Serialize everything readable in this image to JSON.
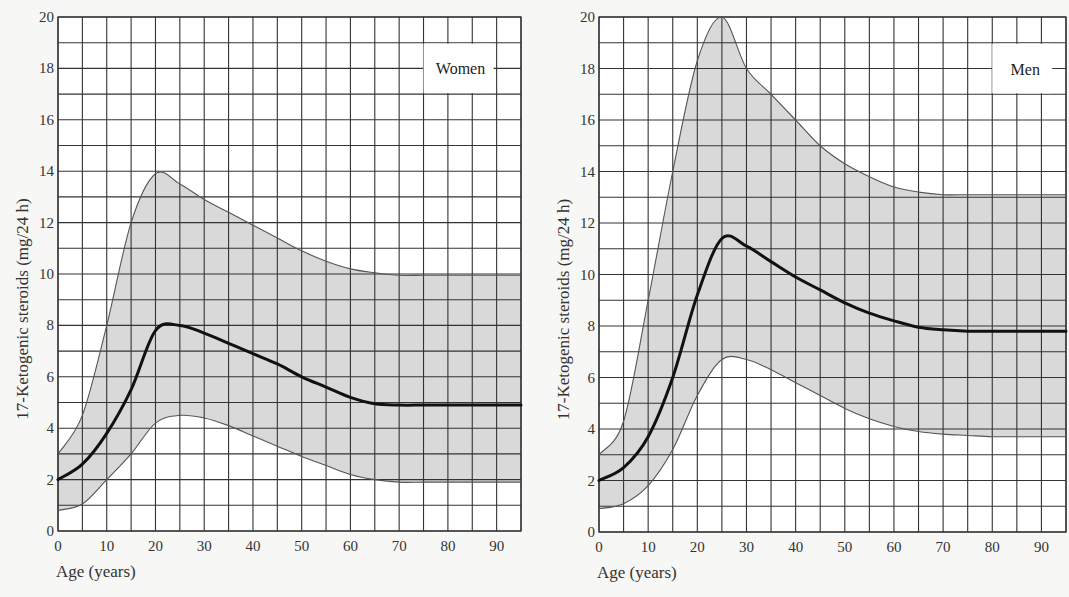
{
  "chart_data": [
    {
      "type": "line",
      "title": "Women",
      "xlabel": "Age (years)",
      "ylabel": "17-Ketogenic steroids (mg/24 h)",
      "xlim": [
        0,
        95
      ],
      "ylim": [
        0,
        20
      ],
      "xticks": [
        0,
        10,
        20,
        30,
        40,
        50,
        60,
        70,
        80,
        90
      ],
      "yticks": [
        0,
        2,
        4,
        6,
        8,
        10,
        12,
        14,
        16,
        18,
        20
      ],
      "grid": true,
      "grid_minor_x": 5,
      "grid_minor_y": 1,
      "legend_position": "top-right",
      "shaded_band": "between upper and lower",
      "x": [
        0,
        5,
        10,
        15,
        20,
        25,
        30,
        35,
        40,
        45,
        50,
        55,
        60,
        65,
        70,
        75,
        80,
        85,
        90,
        95
      ],
      "series": [
        {
          "name": "upper",
          "values": [
            3.0,
            4.5,
            8.0,
            12.0,
            13.9,
            13.5,
            12.9,
            12.4,
            11.9,
            11.4,
            10.9,
            10.5,
            10.2,
            10.05,
            9.95,
            9.95,
            9.95,
            9.95,
            9.95,
            9.95
          ]
        },
        {
          "name": "mean",
          "values": [
            2.0,
            2.6,
            3.8,
            5.5,
            7.8,
            8.0,
            7.7,
            7.3,
            6.9,
            6.5,
            6.0,
            5.6,
            5.2,
            4.95,
            4.9,
            4.9,
            4.9,
            4.9,
            4.9,
            4.9
          ]
        },
        {
          "name": "lower",
          "values": [
            0.8,
            1.05,
            2.0,
            3.0,
            4.2,
            4.5,
            4.4,
            4.1,
            3.7,
            3.3,
            2.9,
            2.55,
            2.2,
            2.0,
            1.9,
            1.9,
            1.9,
            1.9,
            1.9,
            1.9
          ]
        }
      ]
    },
    {
      "type": "line",
      "title": "Men",
      "xlabel": "Age (years)",
      "ylabel": "17-Ketogenic steroids (mg/24 h)",
      "xlim": [
        0,
        95
      ],
      "ylim": [
        0,
        20
      ],
      "xticks": [
        0,
        10,
        20,
        30,
        40,
        50,
        60,
        70,
        80,
        90
      ],
      "yticks": [
        0,
        2,
        4,
        6,
        8,
        10,
        12,
        14,
        16,
        18,
        20
      ],
      "grid": true,
      "grid_minor_x": 5,
      "grid_minor_y": 1,
      "legend_position": "top-right",
      "shaded_band": "between upper and lower",
      "x": [
        0,
        5,
        10,
        15,
        20,
        25,
        30,
        35,
        40,
        45,
        50,
        55,
        60,
        65,
        70,
        75,
        80,
        85,
        90,
        95
      ],
      "series": [
        {
          "name": "upper",
          "values": [
            3.0,
            4.3,
            9.0,
            14.0,
            18.3,
            20.0,
            18.0,
            17.0,
            16.0,
            15.0,
            14.3,
            13.8,
            13.4,
            13.2,
            13.1,
            13.1,
            13.1,
            13.1,
            13.1,
            13.1
          ]
        },
        {
          "name": "mean",
          "values": [
            2.0,
            2.5,
            3.7,
            6.0,
            9.2,
            11.4,
            11.1,
            10.5,
            9.9,
            9.4,
            8.9,
            8.5,
            8.2,
            7.95,
            7.85,
            7.8,
            7.8,
            7.8,
            7.8,
            7.8
          ]
        },
        {
          "name": "lower",
          "values": [
            0.9,
            1.1,
            1.8,
            3.2,
            5.3,
            6.7,
            6.7,
            6.3,
            5.8,
            5.3,
            4.8,
            4.4,
            4.1,
            3.9,
            3.8,
            3.75,
            3.7,
            3.7,
            3.7,
            3.7
          ]
        }
      ]
    }
  ],
  "colors": {
    "band_fill": "#d9d9d9",
    "grid": "#333333",
    "mean_line": "#111111",
    "bound_line": "#555555",
    "background": "#ffffff"
  }
}
